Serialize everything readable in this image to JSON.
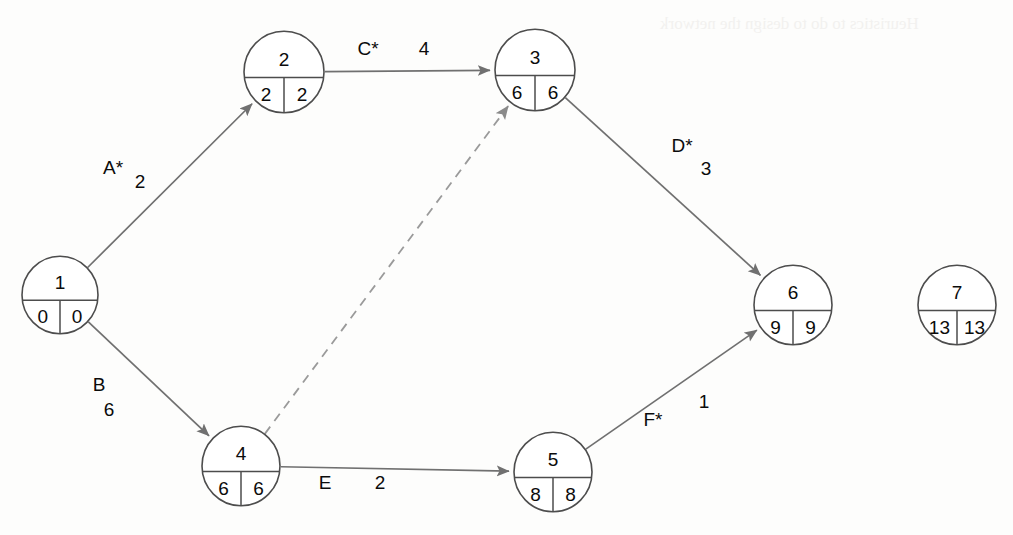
{
  "diagram": {
    "type": "activity-on-arrow network (CPM/PERT)",
    "nodes": [
      {
        "id": "1",
        "label": "1",
        "early": "0",
        "late": "0",
        "cx": 60,
        "cy": 295,
        "r": 38
      },
      {
        "id": "2",
        "label": "2",
        "early": "2",
        "late": "2",
        "cx": 284,
        "cy": 72,
        "r": 40
      },
      {
        "id": "3",
        "label": "3",
        "early": "6",
        "late": "6",
        "cx": 535,
        "cy": 70,
        "r": 40
      },
      {
        "id": "4",
        "label": "4",
        "early": "6",
        "late": "6",
        "cx": 241,
        "cy": 466,
        "r": 39
      },
      {
        "id": "5",
        "label": "5",
        "early": "8",
        "late": "8",
        "cx": 553,
        "cy": 472,
        "r": 39
      },
      {
        "id": "6",
        "label": "6",
        "early": "9",
        "late": "9",
        "cx": 793,
        "cy": 305,
        "r": 39
      },
      {
        "id": "7",
        "label": "7",
        "early": "13",
        "late": "13",
        "cx": 957,
        "cy": 305,
        "r": 39
      }
    ],
    "edges": [
      {
        "id": "A",
        "from": "1",
        "to": "2",
        "activity": "A*",
        "duration": "2",
        "style": "solid",
        "label_x": 113,
        "label_y": 167,
        "dur_x": 140,
        "dur_y": 181
      },
      {
        "id": "B",
        "from": "1",
        "to": "4",
        "activity": "B",
        "duration": "6",
        "style": "solid",
        "label_x": 99,
        "label_y": 384,
        "dur_x": 109,
        "dur_y": 409
      },
      {
        "id": "C",
        "from": "2",
        "to": "3",
        "activity": "C*",
        "duration": "4",
        "style": "solid",
        "label_x": 368,
        "label_y": 48,
        "dur_x": 424,
        "dur_y": 48
      },
      {
        "id": "D",
        "from": "3",
        "to": "6",
        "activity": "D*",
        "duration": "3",
        "style": "solid",
        "label_x": 682,
        "label_y": 145,
        "dur_x": 706,
        "dur_y": 168
      },
      {
        "id": "E",
        "from": "4",
        "to": "5",
        "activity": "E",
        "duration": "2",
        "style": "solid",
        "label_x": 325,
        "label_y": 482,
        "dur_x": 380,
        "dur_y": 482
      },
      {
        "id": "F",
        "from": "5",
        "to": "6",
        "activity": "F*",
        "duration": "1",
        "style": "solid",
        "label_x": 653,
        "label_y": 419,
        "dur_x": 704,
        "dur_y": 401
      },
      {
        "id": "dummy",
        "from": "4",
        "to": "3",
        "activity": "",
        "duration": "",
        "style": "dashed",
        "label_x": 0,
        "label_y": 0,
        "dur_x": 0,
        "dur_y": 0
      }
    ],
    "critical_path_marker": "*",
    "colors": {
      "node_stroke": "#4d4d4d",
      "edge_stroke": "#707070",
      "dummy_stroke": "#9a9a9a",
      "text": "#0b0b0b",
      "background": "#fdfdfc"
    }
  },
  "artifacts": {
    "bleed_through_text": "Heuristics to do to design the network"
  }
}
